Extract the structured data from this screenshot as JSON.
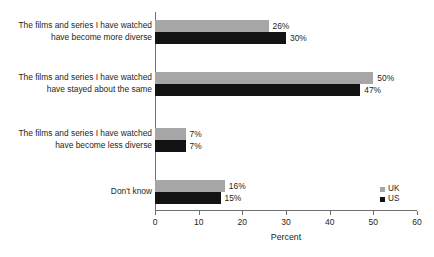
{
  "chart_data": {
    "type": "bar",
    "orientation": "horizontal",
    "title": "",
    "xlabel": "Percent",
    "ylabel": "",
    "xlim": [
      0,
      60
    ],
    "xticks": [
      0,
      10,
      20,
      30,
      40,
      50,
      60
    ],
    "grid": false,
    "legend_position": "bottom-right",
    "categories": [
      "The films and series I have watched\nhave become more diverse",
      "The films and series I have watched\nhave stayed about the same",
      "The films and series I have watched\nhave become less diverse",
      "Don't know"
    ],
    "series": [
      {
        "name": "UK",
        "color": "#a6a6a6",
        "values": [
          26,
          50,
          7,
          16
        ],
        "labels": [
          "26%",
          "50%",
          "7%",
          "16%"
        ]
      },
      {
        "name": "US",
        "color": "#131313",
        "values": [
          30,
          47,
          7,
          15
        ],
        "labels": [
          "30%",
          "47%",
          "7%",
          "15%"
        ]
      }
    ],
    "tick_labels": [
      "0",
      "10",
      "20",
      "30",
      "40",
      "50",
      "60"
    ]
  }
}
